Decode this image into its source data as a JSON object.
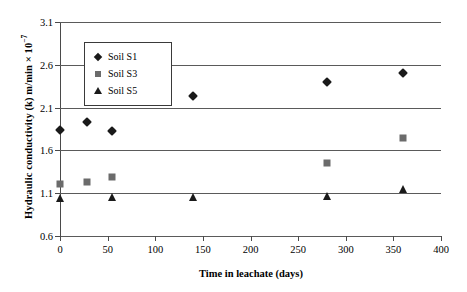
{
  "chart_data": {
    "type": "scatter",
    "title": "",
    "xlabel": "Time in leachate (days)",
    "ylabel": "Hydraulic conductivity (k) m/min × 10",
    "ylabel_exponent": "−7",
    "xlim": [
      0,
      400
    ],
    "ylim": [
      0.6,
      3.1
    ],
    "xticks": [
      0,
      50,
      100,
      150,
      200,
      250,
      300,
      350,
      400
    ],
    "xtick_labels": [
      "0",
      "50",
      "100",
      "150",
      "200",
      "250",
      "300",
      "350",
      "400"
    ],
    "yticks": [
      0.6,
      1.1,
      1.6,
      2.1,
      2.6,
      3.1
    ],
    "ytick_labels": [
      "0.6",
      "1.1",
      "1.6",
      "2.1",
      "2.6",
      "3.1"
    ],
    "grid": "horizontal",
    "legend_position": "upper-left-inside",
    "series": [
      {
        "name": "Soil S1",
        "marker": "diamond",
        "color": "#1a1a1a",
        "x": [
          0,
          28,
          55,
          140,
          280,
          360
        ],
        "y": [
          1.84,
          1.93,
          1.83,
          2.24,
          2.4,
          2.5
        ]
      },
      {
        "name": "Soil S3",
        "marker": "square",
        "color": "#6b6b6b",
        "x": [
          0,
          28,
          55,
          280,
          360
        ],
        "y": [
          1.21,
          1.23,
          1.29,
          1.45,
          1.74
        ]
      },
      {
        "name": "Soil S5",
        "marker": "triangle",
        "color": "#1a1a1a",
        "x": [
          0,
          55,
          140,
          280,
          360
        ],
        "y": [
          1.04,
          1.06,
          1.05,
          1.07,
          1.15
        ]
      }
    ]
  }
}
